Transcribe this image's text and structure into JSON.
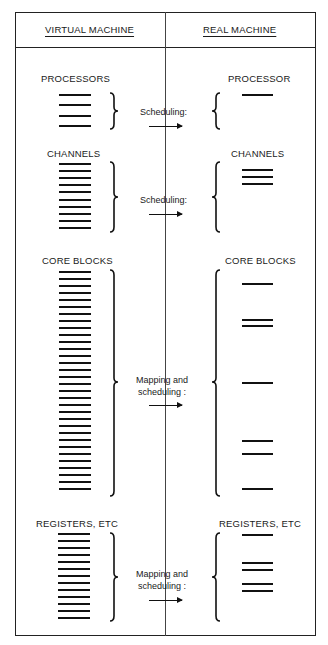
{
  "header": {
    "left_title": "VIRTUAL MACHINE",
    "right_title": "REAL MACHINE"
  },
  "sections": [
    {
      "id": "processors",
      "virtual_label": "PROCESSORS",
      "real_label": "PROCESSOR",
      "operation": [
        "Scheduling:"
      ],
      "virtual_line_count": 4,
      "real_line_groups": [
        1
      ]
    },
    {
      "id": "channels",
      "virtual_label": "CHANNELS",
      "real_label": "CHANNELS",
      "operation": [
        "Scheduling:"
      ],
      "virtual_line_count": 10,
      "real_line_groups": [
        3
      ]
    },
    {
      "id": "core-blocks",
      "virtual_label": "CORE BLOCKS",
      "real_label": "CORE BLOCKS",
      "operation": [
        "Mapping and",
        "scheduling :"
      ],
      "virtual_line_count": 32,
      "real_line_groups": [
        1,
        2,
        1,
        2,
        1
      ]
    },
    {
      "id": "registers",
      "virtual_label": "REGISTERS, ETC",
      "real_label": "REGISTERS, ETC",
      "operation": [
        "Mapping and",
        "scheduling :"
      ],
      "virtual_line_count": 13,
      "real_line_groups": [
        1,
        2,
        2
      ]
    }
  ],
  "colors": {
    "ink": "#111111",
    "background": "#ffffff"
  }
}
